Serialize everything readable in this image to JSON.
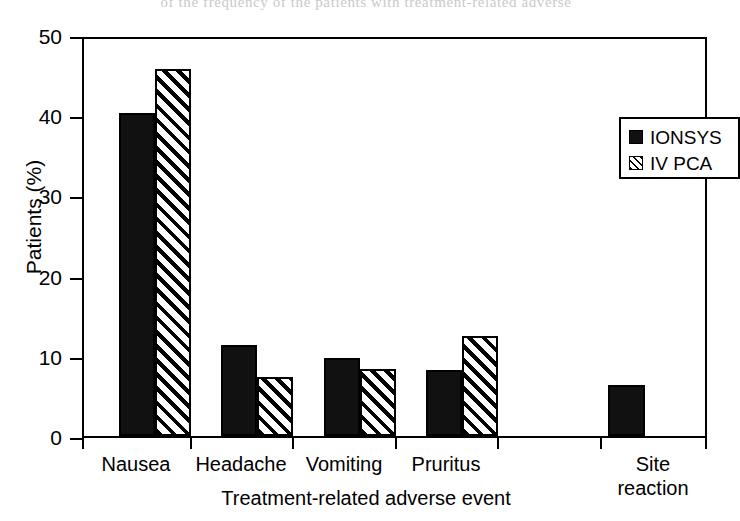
{
  "page": {
    "top_cut_text": "of the frequency of the patients with treatment-related adverse"
  },
  "chart_data": {
    "type": "bar",
    "title": "",
    "xlabel": "Treatment-related adverse event",
    "ylabel": "Patients (%)",
    "categories": [
      "Nausea",
      "Headache",
      "Vomiting",
      "Pruritus",
      "Site reaction"
    ],
    "category_lines": [
      [
        "Nausea"
      ],
      [
        "Headache"
      ],
      [
        "Vomiting"
      ],
      [
        "Pruritus"
      ],
      [
        "Site",
        "reaction"
      ]
    ],
    "series": [
      {
        "name": "IONSYS",
        "fill": "solid",
        "color": "#111111",
        "values": [
          40.7,
          11.5,
          9.8,
          8.3,
          6.4
        ]
      },
      {
        "name": "IV PCA",
        "fill": "hatch",
        "color": "#000000",
        "values": [
          46.2,
          7.4,
          8.5,
          12.6,
          null
        ]
      }
    ],
    "ylim": [
      0,
      50
    ],
    "yticks": [
      0,
      10,
      20,
      30,
      40,
      50
    ],
    "ytick_labels": [
      "0",
      "10",
      "20",
      "30",
      "40",
      "50"
    ],
    "grid": false,
    "legend_position": "upper right",
    "legend_entries": [
      "IONSYS",
      "IV PCA"
    ]
  }
}
